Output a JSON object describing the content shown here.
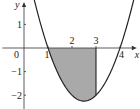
{
  "chart_data": {
    "type": "line",
    "title": "",
    "xlabel": "x",
    "ylabel": "y",
    "function": "y = (x - 1)(x - 4)",
    "coefficients": {
      "a": 1,
      "b": -5,
      "c": 4
    },
    "xlim": [
      -0.9,
      4.7
    ],
    "ylim": [
      -2.6,
      1.95
    ],
    "curve_domain": [
      0.3,
      4.6
    ],
    "x_ticks": [
      1,
      2,
      3,
      4
    ],
    "x_tick_labels": [
      "1",
      "2",
      "3",
      "4"
    ],
    "y_ticks": [
      1,
      -1,
      -2
    ],
    "y_tick_labels": [
      "1",
      "−1",
      "−2"
    ],
    "origin_label": "0",
    "shaded_region": {
      "x_from": 1,
      "x_to": 3,
      "between": "curve and x-axis",
      "color": "#a9a9a9"
    },
    "vertical_line_at": 3,
    "grid": false,
    "colors": {
      "curve": "#222222",
      "axis": "#333333",
      "fill": "#a9a9a9"
    }
  }
}
